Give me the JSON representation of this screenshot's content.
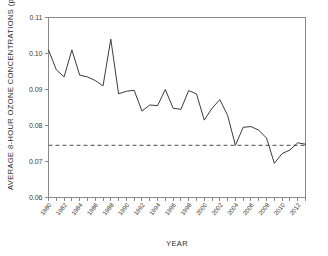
{
  "chart_data": {
    "type": "line",
    "title": "",
    "xlabel": "YEAR",
    "ylabel": "AVERAGE 8-HOUR OZONE CONCENTRATIONS (ppm)",
    "ylim": [
      0.06,
      0.11
    ],
    "xlim": [
      1980,
      2013
    ],
    "grid": false,
    "legend": "none",
    "ytick_labels": [
      "0.11",
      "0.10",
      "0.09",
      "0.08",
      "0.07",
      "0.06"
    ],
    "ytick_values": [
      0.11,
      0.1,
      0.09,
      0.08,
      0.07,
      0.06
    ],
    "xtick_labels": [
      "1980",
      "1982",
      "1984",
      "1986",
      "1988",
      "1990",
      "1992",
      "1994",
      "1996",
      "1998",
      "2000",
      "2002",
      "2004",
      "2006",
      "2008",
      "2010",
      "2012"
    ],
    "xtick_values": [
      1980,
      1982,
      1984,
      1986,
      1988,
      1990,
      1992,
      1994,
      1996,
      1998,
      2000,
      2002,
      2004,
      2006,
      2008,
      2010,
      2012
    ],
    "x": [
      1980,
      1981,
      1982,
      1983,
      1984,
      1985,
      1986,
      1987,
      1988,
      1989,
      1990,
      1991,
      1992,
      1993,
      1994,
      1995,
      1996,
      1997,
      1998,
      1999,
      2000,
      2001,
      2002,
      2003,
      2004,
      2005,
      2006,
      2007,
      2008,
      2009,
      2010,
      2011,
      2012,
      2013
    ],
    "series": [
      {
        "name": "Average 8-hour ozone concentration",
        "values": [
          0.101,
          0.0955,
          0.0935,
          0.101,
          0.094,
          0.0935,
          0.0925,
          0.091,
          0.104,
          0.0888,
          0.0895,
          0.0898,
          0.084,
          0.0857,
          0.0855,
          0.09,
          0.0848,
          0.0845,
          0.0897,
          0.0888,
          0.0815,
          0.0848,
          0.0872,
          0.0828,
          0.0745,
          0.0795,
          0.0797,
          0.0787,
          0.0765,
          0.0695,
          0.0722,
          0.0732,
          0.0752,
          0.0748
        ],
        "color": "#3c3c3c"
      }
    ],
    "reference_line": {
      "label": "",
      "value": 0.0745,
      "style": "dashed",
      "color": "#6f6f6f"
    }
  },
  "figure": {
    "background_color": "#ffffff",
    "axis_color": "#8a8a8a"
  }
}
